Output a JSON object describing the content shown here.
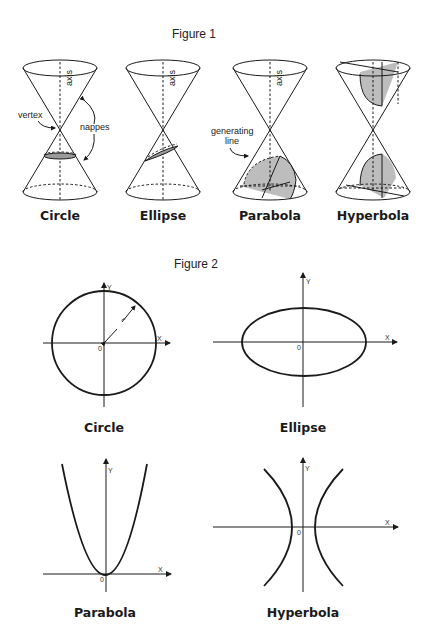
{
  "figure1": {
    "title": "Figure 1",
    "cones": [
      {
        "caption": "Circle"
      },
      {
        "caption": "Ellipse"
      },
      {
        "caption": "Parabola"
      },
      {
        "caption": "Hyperbola"
      }
    ],
    "annotations": {
      "axis": "axis",
      "vertex": "vertex",
      "nappes": "nappes",
      "generating_line_1": "generating",
      "generating_line_2": "line"
    }
  },
  "figure2": {
    "title": "Figure 2",
    "plots": [
      {
        "caption": "Circle",
        "x_label": "X",
        "y_label": "Y",
        "origin_label": "0",
        "radius_label": "r"
      },
      {
        "caption": "Ellipse",
        "x_label": "X",
        "y_label": "Y",
        "origin_label": "0"
      },
      {
        "caption": "Parabola",
        "x_label": "X",
        "y_label": "Y",
        "origin_label": "0"
      },
      {
        "caption": "Hyperbola",
        "x_label": "X",
        "y_label": "Y",
        "origin_label": "0"
      }
    ]
  },
  "colors": {
    "line": "#1a1a1a",
    "shade": "#bdbdbd",
    "background": "#ffffff"
  }
}
